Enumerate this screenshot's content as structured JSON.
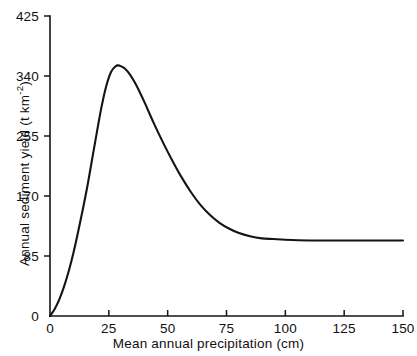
{
  "chart_data": {
    "type": "line",
    "title": "",
    "xlabel": "Mean annual precipitation (cm)",
    "ylabel": "Annual sediment yield (t km",
    "ylabel_sup": "-2",
    "ylabel_tail": ")",
    "xlim": [
      0,
      150
    ],
    "ylim": [
      0,
      425
    ],
    "grid": false,
    "legend": null,
    "curve_color": "#141414",
    "axis_color": "#151515",
    "xticks": [
      0,
      25,
      50,
      75,
      100,
      125,
      150
    ],
    "xtick_labels": [
      "0",
      "25",
      "50",
      "75",
      "100",
      "125",
      "150"
    ],
    "yticks": [
      0,
      85,
      170,
      255,
      340,
      425
    ],
    "ytick_labels": [
      "0",
      "85",
      "170",
      "255",
      "340",
      "425"
    ],
    "series": [
      {
        "name": "Annual sediment yield",
        "x": [
          0,
          2,
          4,
          6,
          8,
          10,
          12,
          14,
          16,
          18,
          20,
          22,
          24,
          26,
          28,
          29,
          30,
          32,
          34,
          36,
          38,
          40,
          44,
          48,
          52,
          56,
          60,
          64,
          68,
          72,
          76,
          80,
          85,
          90,
          95,
          100,
          110,
          120,
          130,
          140,
          150
        ],
        "y": [
          0,
          10,
          24,
          42,
          64,
          90,
          120,
          152,
          186,
          224,
          262,
          298,
          327,
          346,
          354,
          355,
          354,
          350,
          342,
          331,
          318,
          304,
          274,
          246,
          220,
          196,
          175,
          157,
          143,
          132,
          124,
          118,
          113,
          110,
          109,
          108,
          107,
          107,
          107,
          107,
          107
        ]
      }
    ],
    "peak": {
      "x": 29,
      "y": 355
    },
    "asymptote": 107
  },
  "plot_geometry": {
    "left": 50,
    "right": 403,
    "top": 16,
    "bottom": 316
  }
}
